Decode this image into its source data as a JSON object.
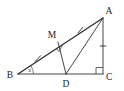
{
  "figure": {
    "kind": "geometry-diagram",
    "background_color": "#ffffff",
    "stroke_color": "#262626",
    "labels": {
      "A": "A",
      "B": "B",
      "C": "C",
      "D": "D",
      "M": "M",
      "angle_b": "x"
    },
    "points": {
      "A": {
        "x": 103,
        "y": 18
      },
      "B": {
        "x": 18,
        "y": 74
      },
      "C": {
        "x": 103,
        "y": 74
      },
      "D": {
        "x": 66,
        "y": 74
      },
      "M": {
        "x": 58,
        "y": 42
      }
    },
    "segments": [
      {
        "name": "BA",
        "from": "B",
        "to": "A",
        "ticks": 0
      },
      {
        "name": "BC",
        "from": "B",
        "to": "C",
        "ticks": 0
      },
      {
        "name": "AC",
        "from": "A",
        "to": "C",
        "ticks": 1
      },
      {
        "name": "MD",
        "from": "M",
        "to": "D",
        "ticks": 0
      },
      {
        "name": "AD",
        "from": "A",
        "to": "D",
        "ticks": 0
      },
      {
        "name": "BM",
        "from": "B",
        "to": "M",
        "ticks": 1
      },
      {
        "name": "MA",
        "from": "M",
        "to": "A",
        "ticks": 1
      }
    ],
    "right_angles": [
      {
        "at": "C",
        "between": "BC and AC"
      },
      {
        "at": "M",
        "between": "BA and MD"
      }
    ],
    "marked_angles": [
      {
        "at": "B",
        "label": "x"
      }
    ],
    "congruence_marks": {
      "single_tick_segments": [
        "BM",
        "MA",
        "AC"
      ]
    }
  }
}
